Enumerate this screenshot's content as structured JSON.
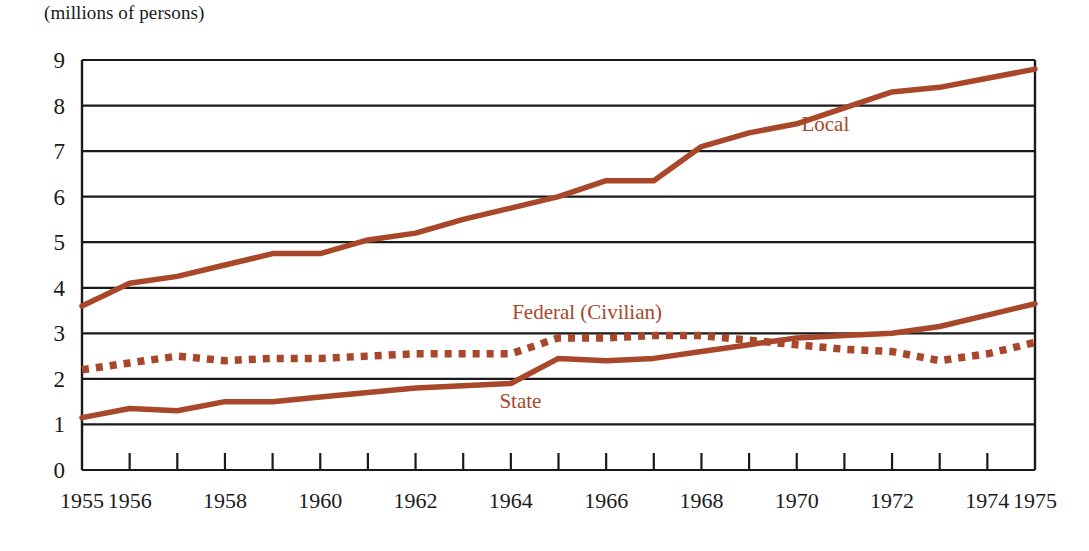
{
  "subtitle": "(millions of persons)",
  "colors": {
    "series": "#a8472a",
    "axis": "#1a1a1a",
    "grid": "#1a1a1a",
    "background": "#ffffff"
  },
  "chart_data": {
    "type": "line",
    "title": "",
    "subtitle": "(millions of persons)",
    "xlabel": "",
    "ylabel": "",
    "ylim": [
      0,
      9
    ],
    "xlim": [
      1955,
      1975
    ],
    "grid": true,
    "legend_position": "inline-annotations",
    "y_ticks": [
      "9",
      "8",
      "7",
      "6",
      "5",
      "4",
      "3",
      "2",
      "1",
      "0"
    ],
    "y_tick_values": [
      9,
      8,
      7,
      6,
      5,
      4,
      3,
      2,
      1,
      0
    ],
    "x_tick_values": [
      1955,
      1956,
      1957,
      1958,
      1959,
      1960,
      1961,
      1962,
      1963,
      1964,
      1965,
      1966,
      1967,
      1968,
      1969,
      1970,
      1971,
      1972,
      1973,
      1974,
      1975
    ],
    "x_tick_labels": [
      "1955",
      "1956",
      "",
      "1958",
      "",
      "1960",
      "",
      "1962",
      "",
      "1964",
      "",
      "1966",
      "",
      "1968",
      "",
      "1970",
      "",
      "1972",
      "",
      "1974",
      "1975"
    ],
    "x": [
      1955,
      1956,
      1957,
      1958,
      1959,
      1960,
      1961,
      1962,
      1963,
      1964,
      1965,
      1966,
      1967,
      1968,
      1969,
      1970,
      1971,
      1972,
      1973,
      1974,
      1975
    ],
    "series": [
      {
        "name": "Local",
        "style": "solid",
        "values": [
          3.6,
          4.1,
          4.25,
          4.5,
          4.75,
          4.75,
          5.05,
          5.2,
          5.5,
          5.75,
          6.0,
          6.35,
          6.35,
          7.1,
          7.4,
          7.6,
          7.95,
          8.3,
          8.4,
          8.6,
          8.8
        ],
        "label_x": 1970.6,
        "label_y": 7.45
      },
      {
        "name": "Federal (Civilian)",
        "style": "dotted",
        "values": [
          2.2,
          2.35,
          2.5,
          2.4,
          2.45,
          2.45,
          2.5,
          2.55,
          2.55,
          2.55,
          2.9,
          2.9,
          2.95,
          2.95,
          2.85,
          2.75,
          2.65,
          2.6,
          2.4,
          2.55,
          2.8
        ],
        "label_x": 1965.6,
        "label_y": 3.32
      },
      {
        "name": "State",
        "style": "solid",
        "values": [
          1.15,
          1.35,
          1.3,
          1.5,
          1.5,
          1.6,
          1.7,
          1.8,
          1.85,
          1.9,
          2.45,
          2.4,
          2.45,
          2.6,
          2.75,
          2.9,
          2.95,
          3.0,
          3.15,
          3.4,
          3.65
        ],
        "label_x": 1964.2,
        "label_y": 1.36
      }
    ]
  }
}
